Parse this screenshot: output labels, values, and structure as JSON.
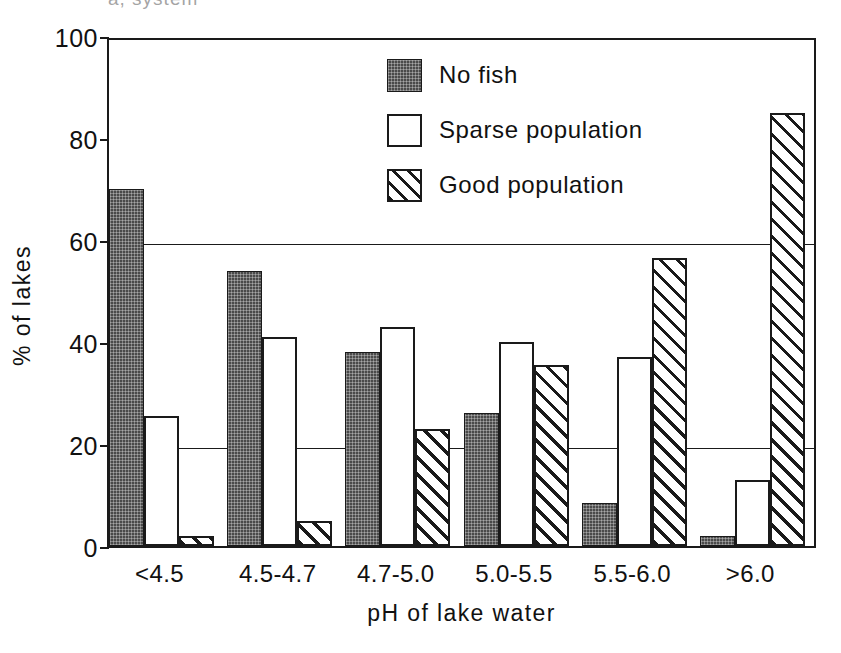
{
  "figure": {
    "top_artifact_text": "a, system",
    "background_color": "#ffffff",
    "ink_color": "#1a1a1a"
  },
  "chart_data": {
    "type": "bar",
    "title": "",
    "subtitle": "",
    "xlabel": "pH of lake water",
    "ylabel": "% of lakes",
    "categories": [
      "<4.5",
      "4.5-4.7",
      "4.7-5.0",
      "5.0-5.5",
      "5.5-6.0",
      ">6.0"
    ],
    "series": [
      {
        "name": "No fish",
        "values": [
          70,
          54,
          38,
          26,
          8.5,
          2
        ],
        "fill": "solid-dark",
        "color": "#4a4a4a"
      },
      {
        "name": "Sparse population",
        "values": [
          25.5,
          41,
          43,
          40,
          37,
          13
        ],
        "fill": "white",
        "color": "#ffffff"
      },
      {
        "name": "Good population",
        "values": [
          2,
          5,
          23,
          35.5,
          56.5,
          85
        ],
        "fill": "diagonal-hatch",
        "color": "#ffffff"
      }
    ],
    "ylim": [
      0,
      100
    ],
    "yticks": [
      0,
      20,
      40,
      60,
      80,
      100
    ],
    "ytick_labels": [
      "0",
      "20",
      "40",
      "60",
      "80",
      "100"
    ],
    "gridlines_at": [
      20,
      60
    ],
    "grid": "partial",
    "legend_position": "upper-center-right",
    "bar_group_order": [
      "No fish",
      "Sparse population",
      "Good population"
    ]
  },
  "legend": {
    "items": [
      {
        "label": "No fish",
        "swatch": "solid-dark-swatch"
      },
      {
        "label": "Sparse population",
        "swatch": "white-swatch"
      },
      {
        "label": "Good population",
        "swatch": "hatched-swatch"
      }
    ]
  }
}
